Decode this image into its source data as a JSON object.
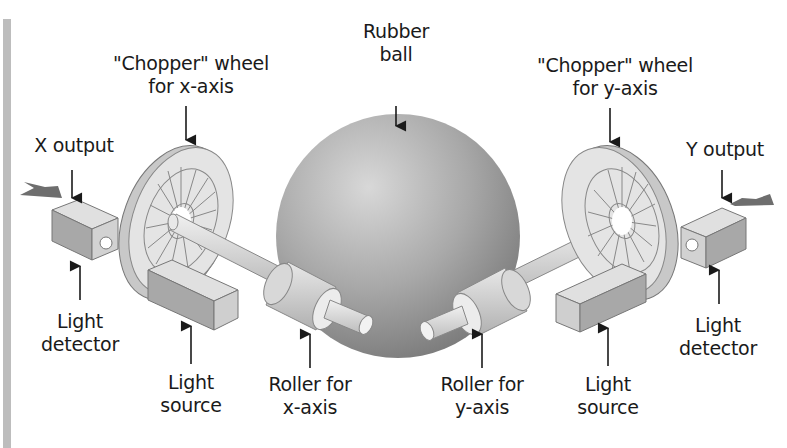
{
  "diagram": {
    "colors": {
      "ball": "#8e8e8e",
      "ball_highlight": "#d6d6d6",
      "component_light": "#e2e2e2",
      "component_mid": "#bdbdbd",
      "component_dark": "#9a9a9a",
      "arrow_output": "#6e6e6e",
      "outline": "#6a6a6a",
      "side_bar": "#bdbdbd"
    },
    "labels": {
      "rubber_ball": {
        "line1": "Rubber",
        "line2": "ball"
      },
      "chopper_x": {
        "line1": "\"Chopper\" wheel",
        "line2": "for x-axis"
      },
      "chopper_y": {
        "line1": "\"Chopper\" wheel",
        "line2": "for y-axis"
      },
      "x_output": {
        "line1": "X output"
      },
      "y_output": {
        "line1": "Y output"
      },
      "light_detector_left": {
        "line1": "Light",
        "line2": "detector"
      },
      "light_detector_right": {
        "line1": "Light",
        "line2": "detector"
      },
      "light_source_left": {
        "line1": "Light",
        "line2": "source"
      },
      "light_source_right": {
        "line1": "Light",
        "line2": "source"
      },
      "roller_x": {
        "line1": "Roller for",
        "line2": "x-axis"
      },
      "roller_y": {
        "line1": "Roller for",
        "line2": "y-axis"
      }
    }
  }
}
